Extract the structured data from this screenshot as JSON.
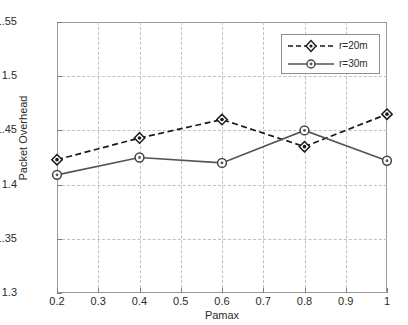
{
  "chart_data": {
    "type": "line",
    "title": "",
    "subtitle": "",
    "xlabel": "Pamax",
    "ylabel": "Packet Overhead",
    "x": [
      0.2,
      0.4,
      0.6,
      0.8,
      1.0
    ],
    "xlim": [
      0.2,
      1.0
    ],
    "ylim": [
      1.3,
      1.55
    ],
    "xticks": [
      "0.2",
      "0.3",
      "0.4",
      "0.5",
      "0.6",
      "0.7",
      "0.8",
      "0.9",
      "1"
    ],
    "xtick_values": [
      0.2,
      0.3,
      0.4,
      0.5,
      0.6,
      0.7,
      0.8,
      0.9,
      1.0
    ],
    "yticks": [
      "1.3",
      "1.35",
      "1.4",
      "1.45",
      "1.5",
      "1.55"
    ],
    "ytick_values": [
      1.3,
      1.35,
      1.4,
      1.45,
      1.5,
      1.55
    ],
    "grid": true,
    "grid_style": "dashed",
    "legend_position": "top-right",
    "series": [
      {
        "name": "r=20m",
        "values": [
          1.423,
          1.443,
          1.46,
          1.435,
          1.465
        ],
        "linestyle": "dashed",
        "marker": "diamond",
        "color": "#1a1a1a"
      },
      {
        "name": "r=30m",
        "values": [
          1.409,
          1.425,
          1.42,
          1.45,
          1.422
        ],
        "linestyle": "solid",
        "marker": "circle",
        "color": "#555555"
      }
    ]
  },
  "legend": {
    "items": [
      {
        "label": "r=20m"
      },
      {
        "label": "r=30m"
      }
    ]
  },
  "colors": {
    "background": "#ffffff",
    "axis": "#9a9a9a",
    "grid": "#c0c0c0",
    "text": "#2b2b2b",
    "series_1": "#1a1a1a",
    "series_2": "#555555"
  }
}
